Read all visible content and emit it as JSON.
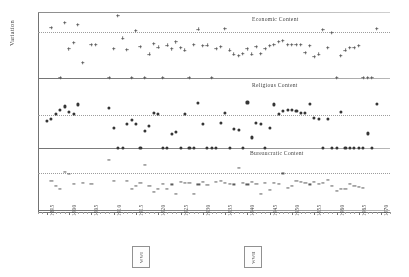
{
  "figure": {
    "ylabel": "Variation",
    "xlabel": ""
  },
  "annotations": [
    {
      "name": "wwi",
      "label": "WWI",
      "year": 1916
    },
    {
      "name": "wwii",
      "label": "WWII",
      "year": 1941
    }
  ],
  "axis": {
    "xmin": 1893,
    "xmax": 1972,
    "tick_years": [
      1895,
      1900,
      1905,
      1910,
      1915,
      1920,
      1925,
      1930,
      1935,
      1940,
      1945,
      1950,
      1955,
      1960,
      1965,
      1970
    ],
    "tick_labels": [
      "1895",
      "1900",
      "1905",
      "1910",
      "1915",
      "1920",
      "1925",
      "1930",
      "1935",
      "1940",
      "1945",
      "1950",
      "1955",
      "1960",
      "1965",
      "1970"
    ]
  },
  "chart_data": {
    "type": "scatter",
    "title": "",
    "xlabel": "",
    "ylabel": "Variation",
    "xlim": [
      1893,
      1972
    ],
    "grid": false,
    "legend": "none",
    "panels": [
      {
        "name": "economic",
        "title": "Economic Content",
        "marker": "plus",
        "ylim": [
          0,
          1
        ],
        "refline": 0.72,
        "x": [
          1896,
          1898,
          1899,
          1900,
          1901,
          1902,
          1903,
          1905,
          1906,
          1909,
          1910,
          1911,
          1912,
          1913,
          1914,
          1915,
          1916,
          1917,
          1918,
          1919,
          1920,
          1921,
          1922,
          1923,
          1924,
          1925,
          1926,
          1927,
          1928,
          1929,
          1930,
          1931,
          1932,
          1933,
          1934,
          1935,
          1936,
          1937,
          1938,
          1939,
          1940,
          1941,
          1942,
          1943,
          1944,
          1945,
          1946,
          1947,
          1948,
          1949,
          1950,
          1951,
          1952,
          1953,
          1954,
          1955,
          1956,
          1957,
          1958,
          1959,
          1960,
          1961,
          1962,
          1963,
          1964,
          1965,
          1966,
          1967,
          1968,
          1969
        ],
        "y": [
          0.78,
          0.0,
          0.86,
          0.45,
          0.55,
          0.83,
          0.24,
          0.52,
          0.52,
          0.0,
          0.46,
          0.97,
          0.62,
          0.44,
          0.0,
          0.74,
          0.49,
          0.0,
          0.37,
          0.53,
          0.48,
          0.0,
          0.51,
          0.45,
          0.56,
          0.47,
          0.43,
          0.0,
          0.52,
          0.76,
          0.5,
          0.51,
          0.0,
          0.46,
          0.49,
          0.77,
          0.43,
          0.37,
          0.35,
          0.38,
          0.45,
          0.37,
          0.49,
          0.38,
          0.46,
          0.5,
          0.52,
          0.57,
          0.58,
          0.52,
          0.52,
          0.52,
          0.52,
          0.39,
          0.5,
          0.33,
          0.37,
          0.75,
          0.47,
          0.71,
          0.0,
          0.35,
          0.43,
          0.47,
          0.47,
          0.5,
          0.0,
          0.0,
          0.0,
          0.77
        ]
      },
      {
        "name": "religious",
        "title": "Religious Content",
        "marker": "dot",
        "ylim": [
          0,
          1
        ],
        "refline": 0.5,
        "x": [
          1895,
          1896,
          1897,
          1898,
          1899,
          1900,
          1901,
          1902,
          1909,
          1910,
          1911,
          1912,
          1913,
          1914,
          1915,
          1916,
          1917,
          1918,
          1919,
          1920,
          1921,
          1922,
          1923,
          1924,
          1925,
          1926,
          1927,
          1928,
          1929,
          1930,
          1931,
          1932,
          1933,
          1934,
          1935,
          1936,
          1937,
          1938,
          1939,
          1940,
          1941,
          1942,
          1943,
          1944,
          1945,
          1946,
          1947,
          1948,
          1949,
          1950,
          1951,
          1952,
          1953,
          1954,
          1955,
          1956,
          1957,
          1958,
          1959,
          1960,
          1961,
          1962,
          1963,
          1964,
          1965,
          1966,
          1967,
          1968,
          1969
        ],
        "y": [
          0.41,
          0.44,
          0.52,
          0.57,
          0.63,
          0.55,
          0.52,
          0.66,
          0.61,
          0.31,
          0.0,
          0.0,
          0.37,
          0.43,
          0.36,
          0.0,
          0.26,
          0.33,
          0.53,
          0.51,
          0.0,
          0.0,
          0.21,
          0.25,
          0.0,
          0.52,
          0.0,
          0.0,
          0.68,
          0.37,
          0.0,
          0.0,
          0.0,
          0.38,
          0.53,
          0.0,
          0.29,
          0.27,
          0.0,
          0.69,
          0.16,
          0.38,
          0.36,
          0.0,
          0.31,
          0.66,
          0.52,
          0.56,
          0.57,
          0.58,
          0.56,
          0.53,
          0.53,
          0.67,
          0.46,
          0.44,
          0.0,
          0.44,
          0.0,
          0.0,
          0.55,
          0.0,
          0.0,
          0.0,
          0.0,
          0.0,
          0.22,
          0.0,
          0.67
        ]
      },
      {
        "name": "bureaucratic",
        "title": "Bureaucratic Content",
        "marker": "dash",
        "ylim": [
          0,
          1
        ],
        "refline": 0.63,
        "x": [
          1896,
          1897,
          1898,
          1899,
          1900,
          1901,
          1903,
          1905,
          1909,
          1910,
          1913,
          1914,
          1915,
          1916,
          1917,
          1918,
          1919,
          1920,
          1921,
          1922,
          1923,
          1924,
          1925,
          1926,
          1927,
          1928,
          1929,
          1930,
          1931,
          1933,
          1934,
          1935,
          1936,
          1937,
          1938,
          1939,
          1940,
          1941,
          1942,
          1943,
          1944,
          1945,
          1946,
          1947,
          1948,
          1949,
          1950,
          1951,
          1952,
          1953,
          1954,
          1955,
          1956,
          1957,
          1958,
          1959,
          1960,
          1961,
          1962,
          1963,
          1964,
          1965,
          1966
        ],
        "y": [
          0.5,
          0.42,
          0.36,
          0.66,
          0.62,
          0.45,
          0.47,
          0.45,
          0.87,
          0.5,
          0.5,
          0.37,
          0.41,
          0.46,
          0.77,
          0.41,
          0.31,
          0.37,
          0.45,
          0.36,
          0.44,
          0.28,
          0.49,
          0.46,
          0.46,
          0.28,
          0.44,
          0.49,
          0.43,
          0.48,
          0.5,
          0.47,
          0.45,
          0.44,
          0.72,
          0.46,
          0.44,
          0.48,
          0.45,
          0.27,
          0.46,
          0.35,
          0.46,
          0.45,
          0.63,
          0.38,
          0.41,
          0.5,
          0.48,
          0.47,
          0.44,
          0.48,
          0.45,
          0.47,
          0.52,
          0.41,
          0.33,
          0.37,
          0.36,
          0.45,
          0.42,
          0.4,
          0.38
        ]
      }
    ]
  }
}
